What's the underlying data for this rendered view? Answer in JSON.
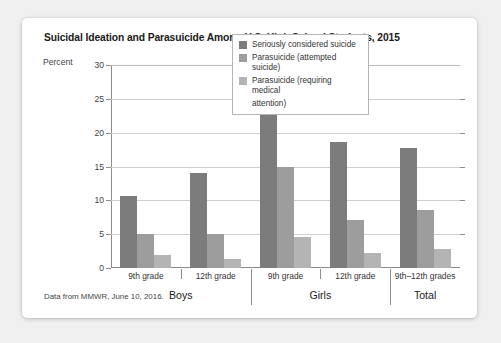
{
  "card": {
    "title": "Suicidal Ideation and Parasuicide Among U.S. High School Students, 2015",
    "source_note": "Data from MMWR, June 10, 2016.",
    "axis_unit_label": "Percent"
  },
  "chart_data": {
    "type": "bar",
    "title": "Suicidal Ideation and Parasuicide Among U.S. High School Students, 2015",
    "xlabel": "",
    "ylabel": "Percent",
    "ylim": [
      0,
      30
    ],
    "yticks": [
      0,
      5,
      10,
      15,
      20,
      25,
      30
    ],
    "grid": true,
    "legend_position": "inside-top-right",
    "categories": [
      "9th grade",
      "12th grade",
      "9th grade",
      "12th grade",
      "9th–12th grades"
    ],
    "groups": [
      {
        "label": "Boys",
        "categories": [
          "9th grade",
          "12th grade"
        ]
      },
      {
        "label": "Girls",
        "categories": [
          "9th grade",
          "12th grade"
        ]
      },
      {
        "label": "Total",
        "categories": [
          "9th–12th grades"
        ]
      }
    ],
    "series": [
      {
        "name": "Seriously considered suicide",
        "color": "#7c7c7c",
        "values": [
          10.6,
          14.0,
          26.5,
          18.6,
          17.7
        ]
      },
      {
        "name": "Parasuicide (attempted suicide)",
        "color": "#9d9d9d",
        "values": [
          5.0,
          5.0,
          14.9,
          7.1,
          8.6
        ]
      },
      {
        "name": "Parasuicide (requiring medical attention)",
        "color": "#b4b4b4",
        "values": [
          1.9,
          1.3,
          4.6,
          2.2,
          2.8
        ]
      }
    ],
    "legend": [
      "Seriously considered suicide",
      "Parasuicide (attempted suicide)",
      "Parasuicide (requiring medical",
      "attention)"
    ],
    "annotations": [
      "Data from MMWR, June 10, 2016."
    ]
  }
}
